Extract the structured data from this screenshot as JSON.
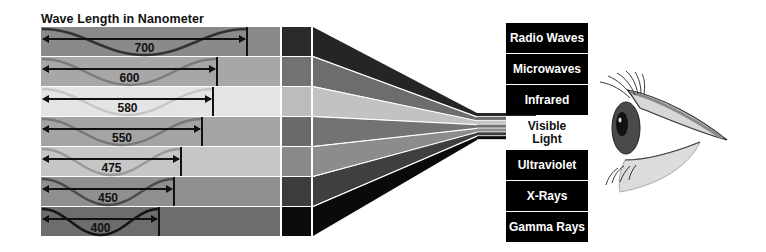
{
  "title": "Wave Length in Nanometer",
  "rows": [
    {
      "label": "700",
      "wave_end_x": 247,
      "fill": "#8a8a8a",
      "wave_color": "#333333",
      "col2": "#2a2a2a",
      "fan": "#252525"
    },
    {
      "label": "600",
      "wave_end_x": 217,
      "fill": "#a7a7a7",
      "wave_color": "#7c7c7c",
      "col2": "#727272",
      "fan": "#6d6d6d"
    },
    {
      "label": "580",
      "wave_end_x": 213,
      "fill": "#e4e4e4",
      "wave_color": "#c6c6c6",
      "col2": "#bcbcbc",
      "fan": "#c2c2c2"
    },
    {
      "label": "550",
      "wave_end_x": 202,
      "fill": "#a4a4a4",
      "wave_color": "#777777",
      "col2": "#6a6a6a",
      "fan": "#737373"
    },
    {
      "label": "475",
      "wave_end_x": 181,
      "fill": "#c6c6c6",
      "wave_color": "#9a9a9a",
      "col2": "#8a8a8a",
      "fan": "#8c8c8c"
    },
    {
      "label": "450",
      "wave_end_x": 174,
      "fill": "#8f8f8f",
      "wave_color": "#4a4a4a",
      "col2": "#3c3c3c",
      "fan": "#3f3f3f"
    },
    {
      "label": "400",
      "wave_end_x": 159,
      "fill": "#6d6d6d",
      "wave_color": "#151515",
      "col2": "#0c0c0c",
      "fan": "#0a0a0a"
    }
  ],
  "spectrum": [
    {
      "label": "Radio Waves"
    },
    {
      "label": "Microwaves"
    },
    {
      "label": "Infrared"
    },
    {
      "label": "Visible Light",
      "line1": "Visible",
      "line2": "Light"
    },
    {
      "label": "Ultraviolet"
    },
    {
      "label": "X-Rays"
    },
    {
      "label": "Gamma Rays"
    }
  ],
  "eye": {
    "description": "side-view-eye-icon"
  }
}
